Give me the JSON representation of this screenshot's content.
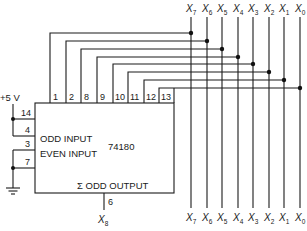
{
  "chip": {
    "part_number": "74180",
    "odd_input_label": "ODD INPUT",
    "even_input_label": "EVEN INPUT",
    "output_label": "Σ ODD OUTPUT"
  },
  "supply_label": "+5 V",
  "top_pins": [
    "1",
    "2",
    "8",
    "9",
    "10",
    "11",
    "12",
    "13"
  ],
  "left_pins": {
    "p14": "14",
    "p4": "4",
    "p3": "3",
    "p7": "7"
  },
  "output_pin": "6",
  "inputs_top": [
    {
      "x": "X",
      "sub": "7"
    },
    {
      "x": "X",
      "sub": "6"
    },
    {
      "x": "X",
      "sub": "5"
    },
    {
      "x": "X",
      "sub": "4"
    },
    {
      "x": "X",
      "sub": "3"
    },
    {
      "x": "X",
      "sub": "2"
    },
    {
      "x": "X",
      "sub": "1"
    },
    {
      "x": "X",
      "sub": "0"
    }
  ],
  "inputs_bottom": [
    {
      "x": "X",
      "sub": "7"
    },
    {
      "x": "X",
      "sub": "6"
    },
    {
      "x": "X",
      "sub": "5"
    },
    {
      "x": "X",
      "sub": "4"
    },
    {
      "x": "X",
      "sub": "3"
    },
    {
      "x": "X",
      "sub": "2"
    },
    {
      "x": "X",
      "sub": "1"
    },
    {
      "x": "X",
      "sub": "0"
    }
  ],
  "output_signal": {
    "x": "X",
    "sub": "8"
  }
}
